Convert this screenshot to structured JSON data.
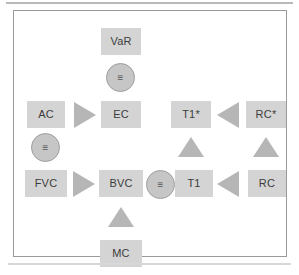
{
  "figure": {
    "frame": {
      "border_color": "#9a9a9a",
      "background": "#ffffff"
    },
    "palette": {
      "node_fill": "#d4d4d4",
      "node_text": "#3c3c3c",
      "marker_fill": "#b6b6b6",
      "circle_fill": "#c6c6c6",
      "circle_border": "#9e9e9e"
    }
  },
  "nodes": [
    {
      "id": "var",
      "label": "VaR",
      "x": 87,
      "y": 17,
      "w": 40,
      "h": 27
    },
    {
      "id": "ac",
      "label": "AC",
      "x": 13,
      "y": 90,
      "w": 38,
      "h": 27
    },
    {
      "id": "ec",
      "label": "EC",
      "x": 87,
      "y": 90,
      "w": 40,
      "h": 27
    },
    {
      "id": "t1s",
      "label": "T1*",
      "x": 157,
      "y": 90,
      "w": 40,
      "h": 27
    },
    {
      "id": "rcs",
      "label": "RC*",
      "x": 232,
      "y": 90,
      "w": 40,
      "h": 27
    },
    {
      "id": "fvc",
      "label": "FVC",
      "x": 11,
      "y": 159,
      "w": 42,
      "h": 27
    },
    {
      "id": "bvc",
      "label": "BVC",
      "x": 85,
      "y": 159,
      "w": 44,
      "h": 27
    },
    {
      "id": "t1",
      "label": "T1",
      "x": 161,
      "y": 159,
      "w": 38,
      "h": 27
    },
    {
      "id": "rc",
      "label": "RC",
      "x": 234,
      "y": 159,
      "w": 38,
      "h": 27
    },
    {
      "id": "mc",
      "label": "MC",
      "x": 86,
      "y": 229,
      "w": 42,
      "h": 27
    }
  ],
  "equivalence_markers": [
    {
      "id": "eq-var-ec",
      "glyph": "≡",
      "x": 92,
      "y": 52,
      "d": 29
    },
    {
      "id": "eq-ac-fvc",
      "glyph": "≡",
      "x": 17,
      "y": 122,
      "d": 29
    },
    {
      "id": "eq-bvc-t1",
      "glyph": "≡",
      "x": 132,
      "y": 159,
      "d": 29
    }
  ],
  "direction_markers": [
    {
      "id": "ac-to-ec",
      "direction": "right",
      "x": 60,
      "y": 91
    },
    {
      "id": "fvc-to-bvc",
      "direction": "right",
      "x": 59,
      "y": 160
    },
    {
      "id": "rcs-to-t1s",
      "direction": "left",
      "x": 203,
      "y": 91
    },
    {
      "id": "rc-to-t1",
      "direction": "left",
      "x": 203,
      "y": 160
    },
    {
      "id": "t1-to-t1s",
      "direction": "up",
      "x": 164,
      "y": 126
    },
    {
      "id": "rc-to-rcs",
      "direction": "up",
      "x": 239,
      "y": 126
    },
    {
      "id": "mc-to-bvc",
      "direction": "up",
      "x": 94,
      "y": 196
    }
  ]
}
